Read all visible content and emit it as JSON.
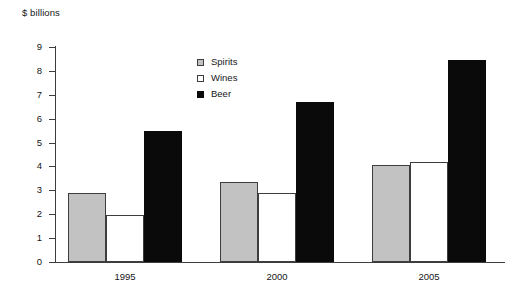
{
  "chart_data": {
    "type": "bar",
    "title": "$ billions",
    "xlabel": "",
    "ylabel": "$ billions",
    "categories": [
      "1995",
      "2000",
      "2005"
    ],
    "series": [
      {
        "name": "Spirits",
        "color": "#c2c2c2",
        "values": [
          2.9,
          3.35,
          4.05
        ]
      },
      {
        "name": "Wines",
        "color": "#ffffff",
        "values": [
          1.95,
          2.9,
          4.2
        ]
      },
      {
        "name": "Beer",
        "color": "#0a0a0a",
        "values": [
          5.5,
          6.7,
          8.45
        ]
      }
    ],
    "ylim": [
      0,
      9
    ],
    "ytick_labels": [
      "0",
      "1",
      "2",
      "3",
      "4",
      "5",
      "6",
      "7",
      "8",
      "9"
    ],
    "ytick_values": [
      0,
      1,
      2,
      3,
      4,
      5,
      6,
      7,
      8,
      9
    ],
    "grid": false,
    "legend_position": "inside-top-center",
    "legend_entries": [
      "Spirits",
      "Wines",
      "Beer"
    ]
  }
}
